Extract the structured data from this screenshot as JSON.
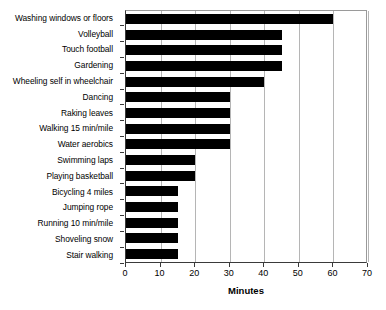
{
  "chart_data": {
    "type": "bar",
    "orientation": "horizontal",
    "title": "",
    "xlabel": "Minutes",
    "ylabel": "",
    "xlim": [
      0,
      70
    ],
    "xticks": [
      0,
      10,
      20,
      30,
      40,
      50,
      60,
      70
    ],
    "grid": true,
    "legend": null,
    "bar_color": "#000000",
    "categories": [
      "Washing windows or floors",
      "Volleyball",
      "Touch football",
      "Gardening",
      "Wheeling self in wheelchair",
      "Dancing",
      "Raking leaves",
      "Walking 15 min/mile",
      "Water aerobics",
      "Swimming laps",
      "Playing basketball",
      "Bicycling 4 miles",
      "Jumping rope",
      "Running 10 min/mile",
      "Shoveling snow",
      "Stair walking"
    ],
    "values": [
      60,
      45,
      45,
      45,
      40,
      30,
      30,
      30,
      30,
      20,
      20,
      15,
      15,
      15,
      15,
      15
    ]
  }
}
